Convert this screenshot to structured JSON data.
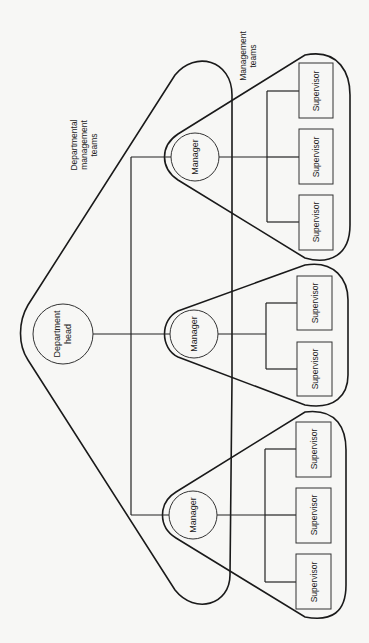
{
  "diagram": {
    "orientation": "rotated-90-ccw",
    "labels": {
      "departmental_teams_line1": "Departmental",
      "departmental_teams_line2": "management",
      "departmental_teams_line3": "teams",
      "management_teams_line1": "Management",
      "management_teams_line2": "teams"
    },
    "department_head": {
      "line1": "Department",
      "line2": "head"
    },
    "teams": [
      {
        "manager": "Manager",
        "supervisors": [
          "Supervisor",
          "Supervisor",
          "Supervisor"
        ]
      },
      {
        "manager": "Manager",
        "supervisors": [
          "Supervisor",
          "Supervisor"
        ]
      },
      {
        "manager": "Manager",
        "supervisors": [
          "Supervisor",
          "Supervisor",
          "Supervisor"
        ]
      }
    ],
    "colors": {
      "background": "#f7f7f5",
      "stroke": "#222222"
    }
  }
}
